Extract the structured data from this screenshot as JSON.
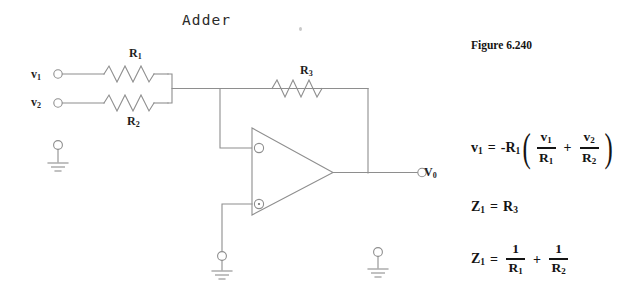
{
  "diagram": {
    "title": "Adder",
    "type": "summing-amplifier-op-amp-circuit"
  },
  "figure": {
    "caption": "Figure 6.240"
  },
  "circuit": {
    "inputs": [
      {
        "id": "v1",
        "label": "v",
        "subscript": "1",
        "terminal": "open-circle",
        "x": 58,
        "y": 74
      },
      {
        "id": "v2",
        "label": "v",
        "subscript": "2",
        "terminal": "open-circle",
        "x": 58,
        "y": 103
      }
    ],
    "resistors": [
      {
        "id": "R1",
        "label": "R",
        "subscript": "1",
        "role": "input-resistor-v1"
      },
      {
        "id": "R2",
        "label": "R",
        "subscript": "2",
        "role": "input-resistor-v2"
      },
      {
        "id": "R3",
        "label": "R",
        "subscript": "3",
        "role": "feedback-resistor"
      }
    ],
    "opamp": {
      "inverting_input": "-",
      "noninverting_input": "+",
      "inverting_marker": "open-circle",
      "noninverting_marker": "dot-circle"
    },
    "output": {
      "label": "V",
      "subscript": "0",
      "terminal": "open-circle"
    },
    "grounds": [
      {
        "id": "ground-input-reference",
        "x": 58,
        "y": 143
      },
      {
        "id": "ground-noninverting",
        "x": 222,
        "y": 258
      },
      {
        "id": "ground-output-reference",
        "x": 378,
        "y": 250
      }
    ]
  },
  "equations": {
    "vout": {
      "lhs_sym": "v",
      "lhs_sub": "1",
      "eq": "=",
      "sign": "-",
      "gain_sym": "R",
      "gain_sub": "1",
      "open_paren": "(",
      "term1_num_sym": "v",
      "term1_num_sub": "1",
      "term1_den_sym": "R",
      "term1_den_sub": "1",
      "plus": "+",
      "term2_num_sym": "v",
      "term2_num_sub": "2",
      "term2_den_sym": "R",
      "term2_den_sub": "2",
      "close_paren": ")"
    },
    "z1_r3": {
      "lhs_sym": "Z",
      "lhs_sub": "1",
      "eq": "=",
      "rhs_sym": "R",
      "rhs_sub": "3"
    },
    "z1_sum": {
      "lhs_sym": "Z",
      "lhs_sub": "1",
      "eq": "=",
      "term1_num": "1",
      "term1_den_sym": "R",
      "term1_den_sub": "1",
      "plus": "+",
      "term2_num": "1",
      "term2_den_sym": "R",
      "term2_den_sub": "2"
    }
  },
  "colors": {
    "background": "#ffffff",
    "wire": "#8a8a8a",
    "text": "#1a1a1a",
    "math": "#141414"
  }
}
